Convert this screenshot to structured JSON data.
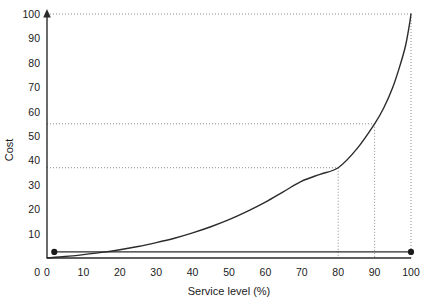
{
  "chart_data": {
    "type": "line",
    "title": "",
    "xlabel": "Service level (%)",
    "ylabel": "Cost",
    "xlim": [
      0,
      100
    ],
    "ylim": [
      0,
      100
    ],
    "grid": false,
    "legend": null,
    "x_ticks": [
      0,
      10,
      20,
      30,
      40,
      50,
      60,
      70,
      80,
      90,
      100
    ],
    "y_ticks": [
      0,
      10,
      20,
      30,
      40,
      50,
      60,
      70,
      80,
      90,
      100
    ],
    "x_tick_labels": [
      "0",
      "10",
      "20",
      "30",
      "40",
      "50",
      "60",
      "70",
      "80",
      "90",
      "100"
    ],
    "y_tick_labels": [
      "0",
      "10",
      "20",
      "30",
      "40",
      "50",
      "60",
      "70",
      "80",
      "90",
      "100"
    ],
    "series": [
      {
        "name": "Cost curve",
        "x": [
          0,
          5,
          10,
          15,
          20,
          25,
          30,
          35,
          40,
          45,
          50,
          55,
          60,
          65,
          70,
          75,
          80,
          85,
          90,
          92.5,
          95,
          97,
          98.5,
          99.5,
          100
        ],
        "y": [
          0,
          0.6,
          1.4,
          2.3,
          3.4,
          4.7,
          6.3,
          8.1,
          10.3,
          12.8,
          15.7,
          19.1,
          22.9,
          27.2,
          31.5,
          34.3,
          37,
          44.5,
          55,
          61.5,
          70,
          79,
          87,
          95,
          100
        ]
      }
    ],
    "annotations": [
      {
        "name": "service-80-cost",
        "x": 80,
        "y": 37,
        "guide": "dotted"
      },
      {
        "name": "service-90-cost",
        "x": 90,
        "y": 55,
        "guide": "dotted"
      },
      {
        "name": "service-100-cost",
        "x": 100,
        "y": 100,
        "guide": "dotted"
      }
    ],
    "reference_lines": {
      "horizontal": [
        37,
        55,
        100
      ],
      "vertical": [
        80,
        90,
        100
      ]
    },
    "markers": [
      {
        "name": "origin-marker",
        "x": 2,
        "y": 2.5
      },
      {
        "name": "right-baseline-marker",
        "x": 100,
        "y": 2.5
      }
    ]
  }
}
